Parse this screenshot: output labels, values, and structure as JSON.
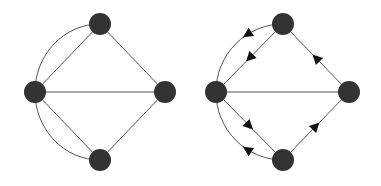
{
  "colors": {
    "node": "#333333",
    "edge": "#555555",
    "arrow": "#111111",
    "background": "#ffffff"
  },
  "graphs": [
    {
      "name": "undirected-graph",
      "nodes": [
        {
          "id": "top",
          "x": 100,
          "y": 24
        },
        {
          "id": "left",
          "x": 35,
          "y": 92
        },
        {
          "id": "right",
          "x": 165,
          "y": 92
        },
        {
          "id": "bottom",
          "x": 100,
          "y": 160
        }
      ],
      "edges": [
        [
          "top",
          "left"
        ],
        [
          "top",
          "right"
        ],
        [
          "left",
          "right"
        ],
        [
          "left",
          "bottom"
        ],
        [
          "bottom",
          "right"
        ]
      ],
      "arc_edges": [
        [
          "left",
          "top"
        ],
        [
          "left",
          "bottom"
        ]
      ]
    },
    {
      "name": "directed-graph",
      "nodes": [
        {
          "id": "top",
          "x": 283,
          "y": 24
        },
        {
          "id": "left",
          "x": 216,
          "y": 92
        },
        {
          "id": "right",
          "x": 349,
          "y": 92
        },
        {
          "id": "bottom",
          "x": 283,
          "y": 160
        }
      ],
      "edges": [
        {
          "from": "top",
          "to": "left",
          "arrow": true
        },
        {
          "from": "right",
          "to": "top",
          "arrow": true
        },
        {
          "from": "left",
          "to": "right",
          "arrow": false
        },
        {
          "from": "left",
          "to": "bottom",
          "arrow": true
        },
        {
          "from": "bottom",
          "to": "right",
          "arrow": true
        }
      ],
      "arc_edges": [
        {
          "from": "top",
          "to": "left",
          "arrow": true
        },
        {
          "from": "left",
          "to": "bottom",
          "arrow": true
        }
      ]
    }
  ]
}
